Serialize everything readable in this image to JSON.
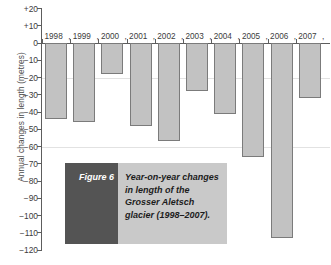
{
  "chart_data": {
    "type": "bar",
    "title": "Year-on-year changes in length of the Grosser Aletsch glacier (1998–2007).",
    "xlabel": "",
    "ylabel": "Annual changes in length (metres)",
    "categories": [
      "1998",
      "1999",
      "2000",
      "2001",
      "2002",
      "2003",
      "2004",
      "2005",
      "2006",
      "2007"
    ],
    "values": [
      -44,
      -46,
      -18,
      -48,
      -57,
      -28,
      -41,
      -66,
      -113,
      -32
    ],
    "ylim": [
      -120,
      20
    ],
    "ytick_labels": [
      "+20",
      "+10",
      "0",
      "−10",
      "−20",
      "−30",
      "−40",
      "−50",
      "−60",
      "−70",
      "−80",
      "−90",
      "−100",
      "−110",
      "−120"
    ],
    "ytick_values": [
      20,
      10,
      0,
      -10,
      -20,
      -30,
      -40,
      -50,
      -60,
      -70,
      -80,
      -90,
      -100,
      -110,
      -120
    ],
    "gridlines": [
      -20,
      -60
    ],
    "grid": true,
    "legend": "none",
    "bar_color": "#c2c2c2",
    "bar_border_color": "#7b7b7b",
    "axis_color": "#5d5d5d"
  },
  "caption": {
    "label": "Figure 6",
    "text": "Year-on-year changes in length of the Grosser Aletsch glacier (1998–2007).",
    "label_bg": "#545454",
    "text_bg": "#c9c9c9"
  }
}
